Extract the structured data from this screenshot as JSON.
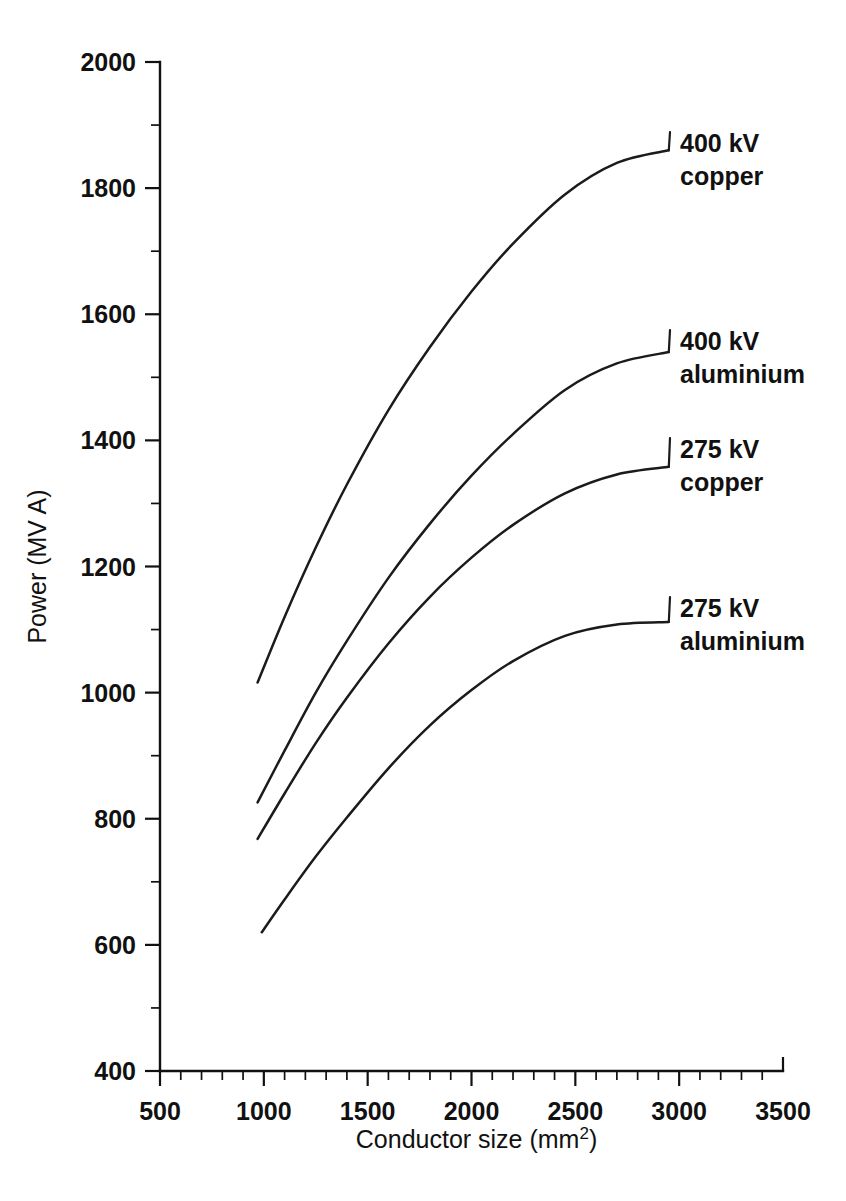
{
  "chart_data": {
    "type": "line",
    "title": "",
    "xlabel": "Conductor size (mm²)",
    "ylabel": "Power (MV A)",
    "xlim": [
      500,
      3500
    ],
    "ylim": [
      400,
      2000
    ],
    "xticks": [
      500,
      1000,
      1500,
      2000,
      2500,
      3000,
      3500
    ],
    "xticklabels": [
      "500",
      "1000",
      "1500",
      "2000",
      "2500",
      "3000",
      "3500"
    ],
    "yticks": [
      400,
      600,
      800,
      1000,
      1200,
      1400,
      1600,
      1800,
      2000
    ],
    "yticklabels": [
      "400",
      "600",
      "800",
      "1000",
      "1200",
      "1400",
      "1600",
      "1800",
      "2000"
    ],
    "x_minor_tick_interval": 100,
    "y_minor_tick_interval": 100,
    "grid": false,
    "legend_position": "inline-right-annotations",
    "series": [
      {
        "name": "400 kV copper",
        "label_line1": "400 kV",
        "label_line2": "copper",
        "x": [
          970,
          1100,
          1250,
          1400,
          1600,
          1800,
          2000,
          2200,
          2450,
          2700,
          2950
        ],
        "values": [
          1016,
          1120,
          1230,
          1330,
          1448,
          1548,
          1636,
          1712,
          1790,
          1840,
          1860
        ]
      },
      {
        "name": "400 kV aluminium",
        "label_line1": "400 kV",
        "label_line2": "aluminium",
        "x": [
          970,
          1100,
          1250,
          1400,
          1600,
          1800,
          2000,
          2200,
          2450,
          2700,
          2950
        ],
        "values": [
          826,
          908,
          1000,
          1082,
          1182,
          1268,
          1344,
          1410,
          1480,
          1522,
          1540
        ]
      },
      {
        "name": "275 kV copper",
        "label_line1": "275 kV",
        "label_line2": "copper",
        "x": [
          970,
          1100,
          1250,
          1400,
          1600,
          1800,
          2000,
          2200,
          2450,
          2700,
          2950
        ],
        "values": [
          768,
          840,
          920,
          992,
          1078,
          1152,
          1214,
          1266,
          1316,
          1346,
          1358
        ]
      },
      {
        "name": "275 kV aluminium",
        "label_line1": "275 kV",
        "label_line2": "aluminium",
        "x": [
          990,
          1100,
          1250,
          1400,
          1600,
          1800,
          2000,
          2200,
          2450,
          2700,
          2950
        ],
        "values": [
          620,
          672,
          740,
          802,
          880,
          948,
          1004,
          1050,
          1090,
          1108,
          1112
        ]
      }
    ]
  },
  "colors": {
    "line": "#1b1b1b",
    "axis": "#111111",
    "background": "#ffffff"
  }
}
